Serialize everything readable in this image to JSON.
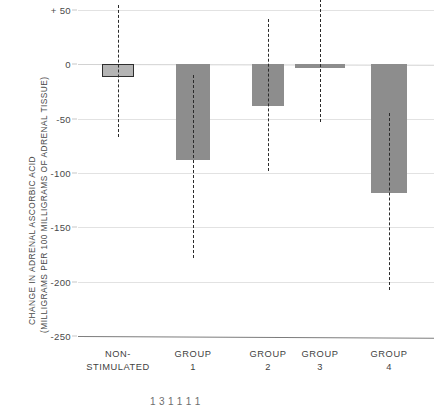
{
  "chart_data": {
    "type": "bar",
    "title": "",
    "subtitle": "",
    "xlabel": "",
    "ylabel_line1": "CHANGE IN ADRENAL ASCORBIC ACID",
    "ylabel_line2": "(MILLIGRAMS PER 100 MILLIGRAMS OF ADRENAL TISSUE)",
    "ylim": [
      -250,
      50
    ],
    "yticks": [
      50,
      0,
      -50,
      -100,
      -150,
      -200,
      -250
    ],
    "ytick_labels": [
      "+ 50",
      "0",
      "-50",
      "-100",
      "-150",
      "-200",
      "-250"
    ],
    "grid": true,
    "legend": "none",
    "categories": [
      "NON-STIMULATED",
      "GROUP 1",
      "GROUP 2",
      "GROUP 3",
      "GROUP 4"
    ],
    "category_labels": [
      {
        "line1": "NON-",
        "line2": "STIMULATED"
      },
      {
        "line1": "GROUP",
        "line2": "1"
      },
      {
        "line1": "GROUP",
        "line2": "2"
      },
      {
        "line1": "GROUP",
        "line2": "3"
      },
      {
        "line1": "GROUP",
        "line2": "4"
      }
    ],
    "values": [
      -12,
      -88,
      -38,
      -3,
      -118
    ],
    "error_ranges": [
      {
        "high": 55,
        "low": -67
      },
      {
        "high": -10,
        "low": -178
      },
      {
        "high": 42,
        "low": -98
      },
      {
        "high": 60,
        "low": -53
      },
      {
        "high": -45,
        "low": -208
      }
    ],
    "bar_styles": [
      "outlined-light",
      "solid-gray",
      "solid-gray",
      "solid-gray",
      "solid-gray"
    ],
    "colors": {
      "bar_fill": "#8d8d8d",
      "bar_fill_light": "#b4b4b4",
      "bar_outline": "#2e2e2e",
      "gridline": "#e2e2e2",
      "baseline": "#7c7c7c",
      "whisker": "#2b2b2b",
      "text": "#3f3f3f",
      "background": "#ffffff"
    }
  },
  "caption_sliver": "1 3 1 1 1 1"
}
